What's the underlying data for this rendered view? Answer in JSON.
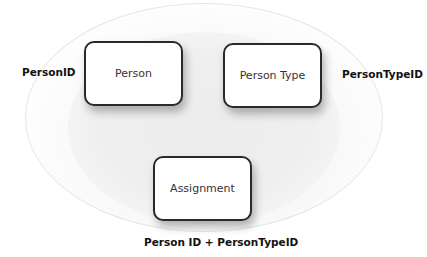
{
  "diagram": {
    "type": "entity-relationship",
    "entities": [
      {
        "id": "person",
        "label": "Person",
        "key": "PersonID"
      },
      {
        "id": "person_type",
        "label": "Person Type",
        "key": "PersonTypeID"
      },
      {
        "id": "assignment",
        "label": "Assignment",
        "key": "Person ID + PersonTypeID"
      }
    ],
    "colors": {
      "box_border": "#2a2a2a",
      "box_fill": "#ffffff",
      "ellipse_fill": "#efefef",
      "text": "#333333"
    }
  }
}
